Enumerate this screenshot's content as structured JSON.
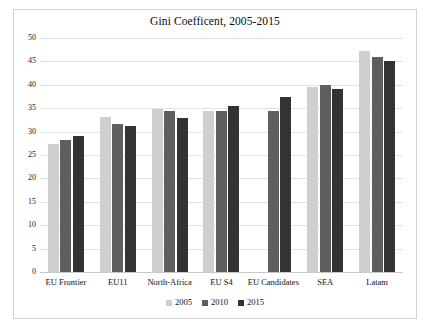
{
  "chart_data": {
    "type": "bar",
    "title": "Gini Coefficent, 2005-2015",
    "xlabel": "",
    "ylabel": "",
    "ylim": [
      0,
      50
    ],
    "ytick_step": 5,
    "yticks": [
      50,
      45,
      40,
      35,
      30,
      25,
      20,
      15,
      10,
      5,
      0
    ],
    "grid": true,
    "legend_position": "bottom",
    "categories": [
      "EU Frontier",
      "EU11",
      "North-Africa",
      "EU S4",
      "EU Candidates",
      "SEA",
      "Latam"
    ],
    "series": [
      {
        "name": "2005",
        "color": "#cfcfcf",
        "values": [
          27.3,
          33.1,
          34.8,
          34.3,
          null,
          39.5,
          47.3
        ]
      },
      {
        "name": "2010",
        "color": "#5e5e5e",
        "values": [
          28.3,
          31.6,
          34.3,
          34.5,
          34.3,
          40.0,
          46.0
        ]
      },
      {
        "name": "2015",
        "color": "#333333",
        "values": [
          29.0,
          31.1,
          33.0,
          35.5,
          37.5,
          39.0,
          45.0
        ]
      }
    ]
  },
  "colors": {
    "frame_border": "#d2d2d2",
    "gridline": "#e2e2e2",
    "axis": "#c9c9c9",
    "text": "#101010",
    "background": "#ffffff"
  }
}
